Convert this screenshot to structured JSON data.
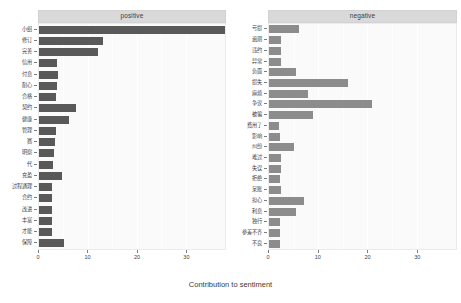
{
  "chart_data": {
    "type": "bar",
    "title": "",
    "xlabel": "Contribution to sentiment",
    "ylabel": "",
    "orientation": "horizontal",
    "grid": true,
    "legend": false,
    "xlim": [
      0,
      38
    ],
    "xticks": [
      0,
      10,
      20,
      30
    ],
    "xticklabels": [
      "0",
      "10",
      "20",
      "30"
    ],
    "facets": [
      {
        "label": "positive",
        "color": "#595959",
        "categories": [
          "小组",
          "修订",
          "完善",
          "信用",
          "付息",
          "耐心",
          "合格",
          "契约",
          "健康",
          "管理",
          "赛",
          "明察",
          "代",
          "充盈",
          "过程通理",
          "合约",
          "改进",
          "丰富",
          "才能",
          "保障"
        ],
        "values": [
          38.0,
          13.0,
          12.0,
          3.6,
          3.8,
          3.6,
          3.4,
          7.5,
          6.2,
          3.4,
          3.2,
          3.0,
          2.8,
          4.6,
          2.6,
          2.6,
          2.6,
          2.6,
          2.6,
          5.2
        ]
      },
      {
        "label": "negative",
        "color": "#8c8c8c",
        "categories": [
          "亏损",
          "逾期",
          "违约",
          "异常",
          "负面",
          "损失",
          "麻烦",
          "争议",
          "被骗",
          "费用了",
          "影响",
          "纠纷",
          "难过",
          "失误",
          "拒绝",
          "呆账",
          "担心",
          "利息",
          "独行",
          "参差不齐",
          "不良"
        ],
        "values": [
          6.0,
          2.4,
          2.4,
          2.4,
          5.5,
          16.0,
          8.0,
          21.0,
          9.0,
          2.0,
          2.2,
          5.0,
          2.4,
          2.4,
          2.2,
          2.4,
          7.2,
          5.5,
          2.2,
          2.2,
          2.2
        ]
      }
    ]
  },
  "axis": {
    "x_title": "Contribution to sentiment"
  }
}
